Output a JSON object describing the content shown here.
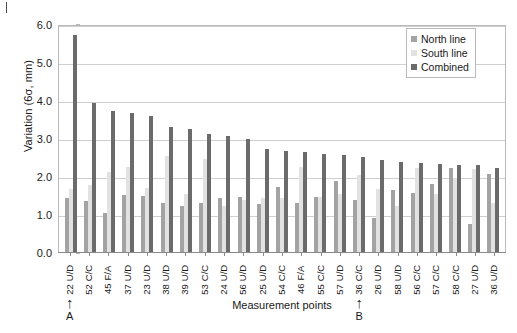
{
  "chart_data": {
    "type": "bar",
    "title": "",
    "xlabel": "Measurement points",
    "ylabel": "Variation (6σ, mm)",
    "ylim": [
      0.0,
      6.0
    ],
    "ytick_step": 1.0,
    "ytick_labels": [
      "6.0",
      "5.0",
      "4.0",
      "3.0",
      "2.0",
      "1.0",
      "0.0"
    ],
    "ytick_values": [
      6.0,
      5.0,
      4.0,
      3.0,
      2.0,
      1.0,
      0.0
    ],
    "grid": true,
    "grid_axis": "y",
    "legend_position": "top-right",
    "categories": [
      "22 U/D",
      "52 C/C",
      "45 F/A",
      "37 U/D",
      "23 U/D",
      "38 U/D",
      "39 U/D",
      "53 C/C",
      "24 U/D",
      "56 U/D",
      "25 U/D",
      "54 C/C",
      "46 F/A",
      "55 C/C",
      "57 U/D",
      "36 C/C",
      "26 U/D",
      "58 U/D",
      "56 C/C",
      "57 C/C",
      "58 C/C",
      "27 U/D",
      "36 U/D"
    ],
    "series": [
      {
        "name": "North line",
        "color": "#a3a3a3",
        "values": [
          1.42,
          1.33,
          1.02,
          1.5,
          1.48,
          1.28,
          1.22,
          1.3,
          1.42,
          1.45,
          1.27,
          1.72,
          1.3,
          1.46,
          1.86,
          1.36,
          0.9,
          1.62,
          1.55,
          1.8,
          2.22,
          0.75,
          2.05
        ]
      },
      {
        "name": "South line",
        "color": "#e2e2e2",
        "values": [
          1.65,
          1.77,
          2.1,
          2.25,
          1.68,
          2.52,
          1.52,
          2.45,
          1.2,
          1.37,
          1.42,
          1.42,
          2.25,
          1.45,
          1.52,
          2.02,
          1.65,
          1.2,
          2.22,
          1.52,
          1.95,
          2.18,
          1.3
        ]
      },
      {
        "name": "Combined",
        "color": "#6b6b6b",
        "values": [
          5.7,
          3.93,
          3.72,
          3.65,
          3.58,
          3.3,
          3.25,
          3.1,
          3.05,
          2.98,
          2.72,
          2.65,
          2.62,
          2.58,
          2.55,
          2.5,
          2.42,
          2.38,
          2.35,
          2.32,
          2.3,
          2.28,
          2.22
        ]
      }
    ],
    "annotations": [
      {
        "label": "A",
        "glyph": "↑",
        "category": "22 U/D",
        "category_index": 0
      },
      {
        "label": "B",
        "glyph": "↑",
        "category": "36 C/C",
        "category_index": 15
      }
    ]
  },
  "legend": {
    "items": [
      {
        "label": "North line",
        "color": "#a3a3a3"
      },
      {
        "label": "South line",
        "color": "#e2e2e2"
      },
      {
        "label": "Combined",
        "color": "#6b6b6b"
      }
    ]
  }
}
